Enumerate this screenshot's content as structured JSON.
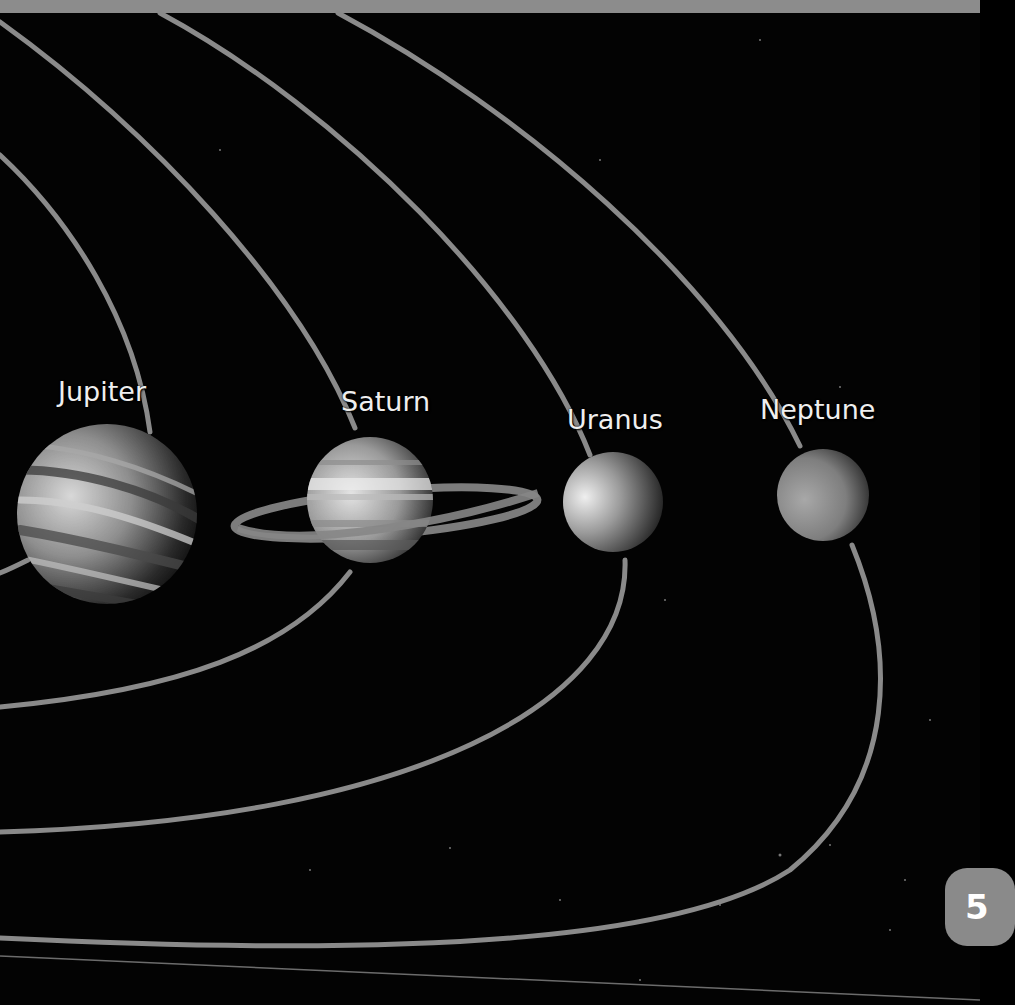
{
  "page": {
    "page_number": "5",
    "top_strip_color": "#8c8c8c",
    "background_color": "#030303",
    "orbit_color": "#8a8a8a"
  },
  "planets": [
    {
      "name": "Jupiter",
      "label": "Jupiter",
      "shape": "banded-sphere"
    },
    {
      "name": "Saturn",
      "label": "Saturn",
      "shape": "ringed-banded-sphere"
    },
    {
      "name": "Uranus",
      "label": "Uranus",
      "shape": "smooth-sphere"
    },
    {
      "name": "Neptune",
      "label": "Neptune",
      "shape": "smooth-sphere"
    }
  ],
  "orbits": [
    "Jupiter orbit",
    "Saturn orbit",
    "Uranus orbit",
    "Neptune orbit"
  ]
}
